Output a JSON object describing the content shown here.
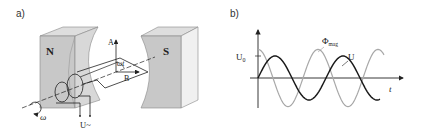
{
  "panel_a": {
    "label": "a)",
    "north_label": "N",
    "south_label": "S",
    "vector_a_label": "A",
    "vector_b_label": "B",
    "angle_label": "ωt",
    "rotation_label": "ω",
    "voltage_label": "U~"
  },
  "panel_b": {
    "label": "b)",
    "amplitude_label": "U",
    "amplitude_subscript": "0",
    "flux_label": "Φ",
    "flux_subscript": "mag",
    "voltage_curve_label": "U",
    "time_axis_label": "t"
  },
  "chart_data": {
    "type": "line",
    "title": "",
    "xlabel": "t",
    "ylabel": "",
    "series": [
      {
        "name": "U",
        "function": "sine",
        "amplitude": 1.0,
        "phase_at_origin": "zero, rising",
        "periods_shown": 1.8,
        "color": "#1a1a1a"
      },
      {
        "name": "Φ_mag",
        "function": "cosine",
        "amplitude": 1.3,
        "phase_at_origin": "maximum",
        "periods_shown": 2.1,
        "color": "#a8a8a8"
      }
    ],
    "annotations": [
      "U_0 marks amplitude of U on y-axis"
    ],
    "grid": false
  },
  "colors": {
    "magnet_face": "#c8c8c8",
    "magnet_side": "#ececec",
    "magnet_top": "#dedede",
    "line": "#222222",
    "flux_curve": "#a8a8a8",
    "voltage_curve": "#1a1a1a"
  }
}
